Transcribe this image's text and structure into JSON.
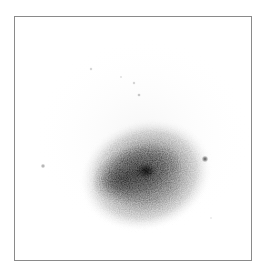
{
  "image": {
    "subject": "galaxy",
    "rendering": "inverted grayscale",
    "colors": {
      "background": "#ffffff",
      "frame_border": "#8a8a8a",
      "halo": "#9a9a9a",
      "core": "#2a2a2a"
    }
  },
  "galaxy": {
    "center": [
      131,
      158
    ],
    "halo_radius": [
      68,
      56
    ],
    "body_center": [
      124,
      155
    ],
    "core_position": [
      131,
      154
    ],
    "rotation_deg": -18
  },
  "point_sources": [
    {
      "id": "star-right",
      "x": 190,
      "y": 142,
      "r": 3.2,
      "opacity": 0.75
    },
    {
      "id": "star-left",
      "x": 28,
      "y": 149,
      "r": 2.2,
      "opacity": 0.45
    },
    {
      "id": "speck-1",
      "x": 76,
      "y": 52,
      "r": 1.2,
      "opacity": 0.35
    },
    {
      "id": "speck-2",
      "x": 106,
      "y": 60,
      "r": 1.0,
      "opacity": 0.3
    },
    {
      "id": "speck-3",
      "x": 119,
      "y": 66,
      "r": 1.2,
      "opacity": 0.35
    },
    {
      "id": "speck-4",
      "x": 124,
      "y": 78,
      "r": 1.3,
      "opacity": 0.4
    },
    {
      "id": "speck-5",
      "x": 196,
      "y": 201,
      "r": 1.0,
      "opacity": 0.25
    }
  ]
}
